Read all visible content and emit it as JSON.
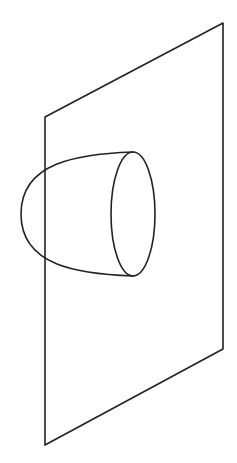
{
  "canvas": {
    "width": 237,
    "height": 463,
    "background": "#ffffff"
  },
  "style": {
    "stroke_color": "#222222",
    "stroke_width": 1.6
  },
  "diagram": {
    "plane": {
      "shape": "parallelogram",
      "points": [
        [
          45,
          117
        ],
        [
          223,
          23
        ],
        [
          223,
          349
        ],
        [
          45,
          445
        ]
      ]
    },
    "cone_rim_ellipse": {
      "cx": 133,
      "cy": 214,
      "rx": 22,
      "ry": 62
    },
    "cone_profile": {
      "apex_left": [
        21,
        214
      ],
      "rim_top": [
        133,
        152
      ],
      "rim_bottom": [
        133,
        276
      ]
    }
  }
}
